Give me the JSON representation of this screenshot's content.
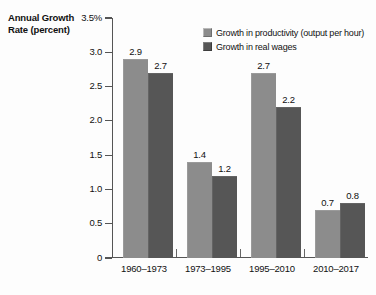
{
  "chart_data": {
    "type": "bar",
    "title": "",
    "ylabel": "Annual Growth Rate (percent)",
    "xlabel": "",
    "categories": [
      "1960–1973",
      "1973–1995",
      "1995–2010",
      "2010–2017"
    ],
    "series": [
      {
        "name": "Growth in productivity (output per hour)",
        "color": "#8c8c8c",
        "values": [
          2.9,
          1.4,
          2.7,
          0.7
        ]
      },
      {
        "name": "Growth in real wages",
        "color": "#565656",
        "values": [
          2.7,
          1.2,
          2.2,
          0.8
        ]
      }
    ],
    "ylim": [
      0,
      3.5
    ],
    "yticks": [
      0,
      0.5,
      1.0,
      1.5,
      2.0,
      2.5,
      3.0,
      3.5
    ],
    "ytick_labels": [
      "0",
      "0.5",
      "1.0",
      "1.5",
      "2.0",
      "2.5",
      "3.0",
      "3.5%"
    ],
    "grid": false,
    "legend_position": "top-right",
    "value_labels": [
      [
        "2.9",
        "2.7"
      ],
      [
        "1.4",
        "1.2"
      ],
      [
        "2.7",
        "2.2"
      ],
      [
        "0.7",
        "0.8"
      ]
    ]
  },
  "axis": {
    "y_title_line1": "Annual Growth",
    "y_title_line2": "Rate (percent)"
  }
}
